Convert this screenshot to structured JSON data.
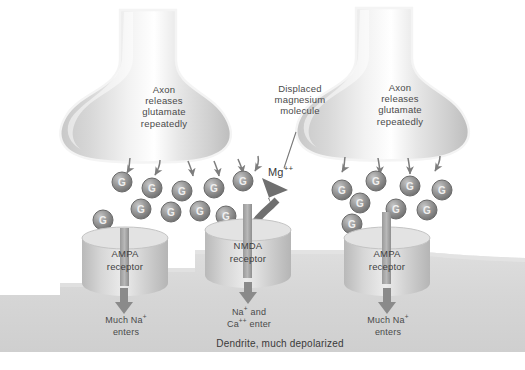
{
  "figure": {
    "caption": "Dendrite, much depolarized",
    "colors": {
      "background": "#ffffff",
      "membrane": "#d9d9d9",
      "dendrite": "#d5d5d5",
      "receptor": "#c9c9c9",
      "glutamate": "#8f8f8f",
      "arrow": "#8a8a8a",
      "text": "#3a3a3a"
    }
  },
  "terminals": [
    {
      "id": "left-axon-terminal",
      "label": "Axon\nreleases\nglutamate\nrepeatedly",
      "release_arrows": 6
    },
    {
      "id": "right-axon-terminal",
      "label": "Axon\nreleases\nglutamate\nrepeatedly",
      "release_arrows": 4
    }
  ],
  "annotations": {
    "displaced_magnesium": "Displaced\nmagnesium\nmolecule",
    "magnesium_ion": "Mg++",
    "magnesium_ion_base": "Mg",
    "magnesium_ion_charge": "++"
  },
  "receptors": [
    {
      "id": "ampa-left",
      "name": "AMPA",
      "name_line2": "receptor",
      "flow_line1": "Much Na+",
      "flow_line1_base": "Much Na",
      "flow_line1_charge": "+",
      "flow_line2": "enters"
    },
    {
      "id": "nmda-center",
      "name": "NMDA",
      "name_line2": "receptor",
      "flow_line1": "Na+ and",
      "flow_line1_base": "Na",
      "flow_line1_charge": "+",
      "flow_line1_tail": " and",
      "flow_line2": "Ca++ enter",
      "flow_line2_base": "Ca",
      "flow_line2_charge": "++",
      "flow_line2_tail": " enter"
    },
    {
      "id": "ampa-right",
      "name": "AMPA",
      "name_line2": "receptor",
      "flow_line1": "Much Na+",
      "flow_line1_base": "Much Na",
      "flow_line1_charge": "+",
      "flow_line2": "enters"
    }
  ],
  "glutamate": {
    "letter": "G",
    "left_cluster_count": 10,
    "right_cluster_count": 8,
    "total": 18
  }
}
